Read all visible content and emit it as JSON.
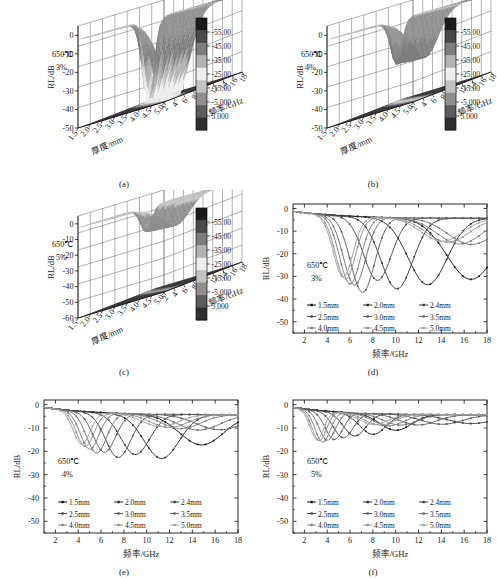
{
  "figure": {
    "caption_panels": [
      "(a)",
      "(b)",
      "(c)",
      "(d)",
      "(e)",
      "(f)"
    ],
    "temperature": "650℃",
    "axis_labels": {
      "rl": "RL/dB",
      "frequency": "频率/GHz",
      "thickness": "厚度/mm"
    }
  },
  "colorbar": {
    "ticks": [
      "-55.00",
      "-45.00",
      "-35.00",
      "-25.00",
      "-15.00",
      "-5.000",
      "5.000"
    ],
    "colors": [
      "#1b1b1b",
      "#4a4a4a",
      "#7d7d7d",
      "#b3b3b3",
      "#eeeeee",
      "#c2c2c2",
      "#8e8e8e",
      "#5c5c5c",
      "#2e2e2e"
    ]
  },
  "legend": {
    "items": [
      "1.5mm",
      "2.0mm",
      "2.4mm",
      "2.5mm",
      "3.0mm",
      "3.5mm",
      "4.0mm",
      "4.5mm",
      "5.0mm"
    ]
  },
  "panels": {
    "a": {
      "label": "(a)",
      "temp": "650℃",
      "conc": "3%",
      "type": "surface3d"
    },
    "b": {
      "label": "(b)",
      "temp": "650℃",
      "conc": "4%",
      "type": "surface3d"
    },
    "c": {
      "label": "(c)",
      "temp": "650℃",
      "conc": "5%",
      "type": "surface3d"
    },
    "d": {
      "label": "(d)",
      "temp": "650℃",
      "conc": "3%",
      "type": "line"
    },
    "e": {
      "label": "(e)",
      "temp": "650℃",
      "conc": "4%",
      "type": "line"
    },
    "f": {
      "label": "(f)",
      "temp": "650℃",
      "conc": "5%",
      "type": "line"
    }
  },
  "chart_data": [
    {
      "id": "a",
      "type": "surface",
      "title": "",
      "panel_label": "(a)",
      "annotations": [
        "650℃",
        "3%"
      ],
      "xlabel": "厚度/mm",
      "ylabel": "频率/GHz",
      "zlabel": "RL/dB",
      "xticks": [
        "1.5",
        "2.0",
        "2.5",
        "3.0",
        "3.5",
        "4.0",
        "4.5",
        "5.0"
      ],
      "yticks": [
        "2",
        "4",
        "6",
        "8",
        "10",
        "12",
        "14",
        "16",
        "18"
      ],
      "zticks": [
        "0",
        "-10",
        "-20",
        "-30",
        "-40",
        "-50"
      ],
      "zlim": [
        -50,
        5
      ],
      "grid": true,
      "colorbar_ticks": [
        "-55.00",
        "-45.00",
        "-35.00",
        "-25.00",
        "-15.00",
        "-5.000",
        "5.000"
      ],
      "min_rl_dB": -50,
      "note": "deep valley ridge sweeping from low frequency at large thickness to high frequency at small thickness"
    },
    {
      "id": "b",
      "type": "surface",
      "panel_label": "(b)",
      "annotations": [
        "650℃",
        "4%"
      ],
      "xlabel": "厚度/mm",
      "ylabel": "频率/GHz",
      "zlabel": "RL/dB",
      "xticks": [
        "1.5",
        "2.0",
        "2.5",
        "3.0",
        "3.5",
        "4.0",
        "4.5",
        "5.0"
      ],
      "yticks": [
        "2",
        "4",
        "6",
        "8",
        "10",
        "12",
        "14",
        "16",
        "18"
      ],
      "zticks": [
        "0",
        "-10",
        "-20",
        "-30",
        "-40",
        "-50"
      ],
      "zlim": [
        -50,
        5
      ],
      "grid": true,
      "colorbar_ticks": [
        "-55.00",
        "-45.00",
        "-35.00",
        "-25.00",
        "-15.00",
        "-5.000",
        "5.000"
      ],
      "min_rl_dB": -25
    },
    {
      "id": "c",
      "type": "surface",
      "panel_label": "(c)",
      "annotations": [
        "650℃",
        "5%"
      ],
      "xlabel": "厚度/mm",
      "ylabel": "频率/GHz",
      "zlabel": "RL/dB",
      "xticks": [
        "1.5",
        "2.0",
        "2.5",
        "3.0",
        "3.5",
        "4.0",
        "4.5",
        "5.0"
      ],
      "yticks": [
        "2",
        "4",
        "6",
        "8",
        "10",
        "12",
        "14",
        "16",
        "18"
      ],
      "zticks": [
        "0",
        "-10",
        "-20",
        "-30",
        "-40",
        "-50",
        "-60"
      ],
      "zlim": [
        -60,
        5
      ],
      "grid": true,
      "colorbar_ticks": [
        "-55.00",
        "-45.00",
        "-35.00",
        "-25.00",
        "-15.00",
        "-5.000",
        "5.000"
      ],
      "min_rl_dB": -15
    },
    {
      "id": "d",
      "type": "line",
      "panel_label": "(d)",
      "annotations": [
        "650℃",
        "3%"
      ],
      "xlabel": "频率/GHz",
      "ylabel": "RL/dB",
      "xticks": [
        2,
        4,
        6,
        8,
        10,
        12,
        14,
        16,
        18
      ],
      "yticks": [
        0,
        -10,
        -20,
        -30,
        -40,
        -50
      ],
      "xlim": [
        1,
        18
      ],
      "ylim": [
        -55,
        2
      ],
      "legend_position": "lower-left",
      "series": [
        {
          "name": "1.5mm",
          "peak_freq": 16.6,
          "peak_rl": -27.0
        },
        {
          "name": "2.0mm",
          "peak_freq": 12.8,
          "peak_rl": -29.5
        },
        {
          "name": "2.4mm",
          "peak_freq": 10.1,
          "peak_rl": -31.5
        },
        {
          "name": "2.5mm",
          "peak_freq": 8.4,
          "peak_rl": -28.0
        },
        {
          "name": "3.0mm",
          "peak_freq": 7.1,
          "peak_rl": -33.5
        },
        {
          "name": "3.5mm",
          "peak_freq": 6.4,
          "peak_rl": -30.5
        },
        {
          "name": "4.0mm",
          "peak_freq": 6.0,
          "peak_rl": -30.0
        },
        {
          "name": "4.5mm",
          "peak_freq": 5.6,
          "peak_rl": -28.0
        },
        {
          "name": "5.0mm",
          "peak_freq": 5.4,
          "peak_rl": -27.0
        }
      ]
    },
    {
      "id": "e",
      "type": "line",
      "panel_label": "(e)",
      "annotations": [
        "650℃",
        "4%"
      ],
      "xlabel": "频率/GHz",
      "ylabel": "RL/dB",
      "xticks": [
        2,
        4,
        6,
        8,
        10,
        12,
        14,
        16,
        18
      ],
      "yticks": [
        0,
        -10,
        -20,
        -30,
        -40,
        -50
      ],
      "xlim": [
        1,
        18
      ],
      "ylim": [
        -55,
        2
      ],
      "legend_position": "lower-left",
      "series": [
        {
          "name": "1.5mm",
          "peak_freq": 14.8,
          "peak_rl": -13.0
        },
        {
          "name": "2.0mm",
          "peak_freq": 11.3,
          "peak_rl": -19.0
        },
        {
          "name": "2.4mm",
          "peak_freq": 9.0,
          "peak_rl": -17.5
        },
        {
          "name": "2.5mm",
          "peak_freq": 7.5,
          "peak_rl": -19.0
        },
        {
          "name": "3.0mm",
          "peak_freq": 6.3,
          "peak_rl": -17.0
        },
        {
          "name": "3.5mm",
          "peak_freq": 5.6,
          "peak_rl": -17.5
        },
        {
          "name": "4.0mm",
          "peak_freq": 5.0,
          "peak_rl": -16.0
        },
        {
          "name": "4.5mm",
          "peak_freq": 4.6,
          "peak_rl": -15.0
        },
        {
          "name": "5.0mm",
          "peak_freq": 4.3,
          "peak_rl": -14.0
        }
      ]
    },
    {
      "id": "f",
      "type": "line",
      "panel_label": "(f)",
      "annotations": [
        "650℃",
        "5%"
      ],
      "xlabel": "频率/GHz",
      "ylabel": "RL/dB",
      "xticks": [
        2,
        4,
        6,
        8,
        10,
        12,
        14,
        16,
        18
      ],
      "yticks": [
        0,
        -10,
        -20,
        -30,
        -40,
        -50
      ],
      "xlim": [
        1,
        18
      ],
      "ylim": [
        -55,
        2
      ],
      "legend_position": "lower-left",
      "series": [
        {
          "name": "1.5mm",
          "peak_freq": 10.0,
          "peak_rl": -7.0
        },
        {
          "name": "2.0mm",
          "peak_freq": 8.0,
          "peak_rl": -9.0
        },
        {
          "name": "2.4mm",
          "peak_freq": 6.4,
          "peak_rl": -10.0
        },
        {
          "name": "2.5mm",
          "peak_freq": 5.4,
          "peak_rl": -11.0
        },
        {
          "name": "3.0mm",
          "peak_freq": 4.6,
          "peak_rl": -12.0
        },
        {
          "name": "3.5mm",
          "peak_freq": 4.0,
          "peak_rl": -12.5
        },
        {
          "name": "4.0mm",
          "peak_freq": 3.6,
          "peak_rl": -13.5
        },
        {
          "name": "4.5mm",
          "peak_freq": 3.3,
          "peak_rl": -13.0
        },
        {
          "name": "5.0mm",
          "peak_freq": 3.1,
          "peak_rl": -12.5
        }
      ]
    }
  ]
}
